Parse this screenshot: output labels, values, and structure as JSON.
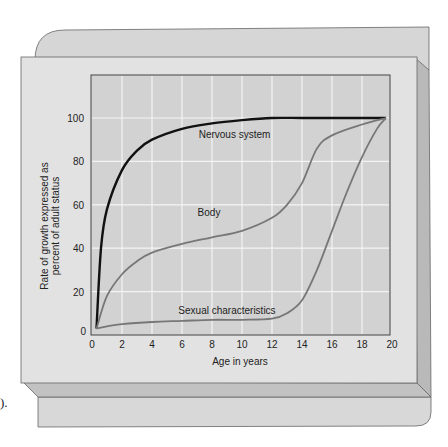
{
  "colors": {
    "panel_back": "#d6d6d6",
    "panel_face": "#e2e2e2",
    "bevel_side": "#b9b9b9",
    "bevel_bottom": "#c4c4c4",
    "plot_bg": "#d2d2d2",
    "grid": "#f4f4f4",
    "nervous_line": "#111111",
    "body_line": "#777777",
    "sexual_line": "#777777"
  },
  "stray_text": ").",
  "chart_data": {
    "type": "line",
    "title": "",
    "xlabel": "Age in years",
    "ylabel": "Rate of growth expressed as percent of adult status",
    "ylabel_lines": [
      "Rate of growth expressed as",
      "percent of adult status"
    ],
    "xlim": [
      0,
      20
    ],
    "ylim": [
      0,
      110
    ],
    "x_ticks": [
      "0",
      "2",
      "4",
      "6",
      "8",
      "10",
      "12",
      "14",
      "16",
      "18",
      "20"
    ],
    "y_ticks": [
      "0",
      "20",
      "40",
      "60",
      "80",
      "100"
    ],
    "grid": true,
    "legend": "inline labels",
    "series": [
      {
        "name": "Nervous system",
        "x": [
          0.3,
          0.6,
          1,
          2,
          3,
          4,
          6,
          8,
          10,
          12,
          14,
          16,
          18,
          19.6
        ],
        "values": [
          3,
          40,
          58,
          76,
          85,
          90,
          95,
          97.5,
          99,
          100,
          100,
          100,
          100,
          100
        ]
      },
      {
        "name": "Body",
        "x": [
          0.3,
          1,
          2,
          3,
          4,
          6,
          8,
          10,
          12,
          13,
          14,
          15,
          16,
          18,
          19.6
        ],
        "values": [
          3,
          18,
          28,
          34,
          38,
          42,
          45,
          48,
          54,
          60,
          70,
          86,
          92,
          97,
          100
        ]
      },
      {
        "name": "Sexual characteristics",
        "x": [
          0.3,
          1,
          2,
          4,
          6,
          8,
          10,
          12,
          13,
          14,
          15,
          16,
          17,
          18,
          19,
          19.6
        ],
        "values": [
          3,
          4,
          5,
          6,
          6.5,
          7,
          7,
          7.5,
          10,
          16,
          30,
          48,
          66,
          82,
          95,
          100
        ]
      }
    ],
    "annotations": [
      {
        "text": "Nervous system",
        "x": 9.5,
        "y": 91
      },
      {
        "text": "Body",
        "x": 7.8,
        "y": 55
      },
      {
        "text": "Sexual characteristics",
        "x": 9,
        "y": 9.5
      }
    ]
  }
}
